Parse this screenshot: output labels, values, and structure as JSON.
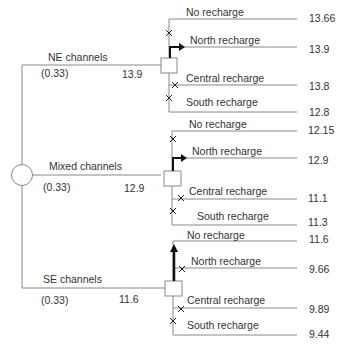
{
  "diagram": {
    "type": "decision-tree",
    "root": {
      "shape": "chance-node-circle"
    },
    "channels": [
      {
        "label": "NE channels",
        "probability": "(0.33)",
        "value": "13.9",
        "decision_box": true,
        "options": [
          {
            "label": "No recharge",
            "value": "13.66",
            "marker": "cross"
          },
          {
            "label": "North recharge",
            "value": "13.9",
            "marker": "arrow-chosen"
          },
          {
            "label": "Central recharge",
            "value": "13.8",
            "marker": "cross"
          },
          {
            "label": "South recharge",
            "value": "12.8",
            "marker": "cross"
          }
        ]
      },
      {
        "label": "Mixed channels",
        "probability": "(0.33)",
        "value": "12.9",
        "decision_box": true,
        "options": [
          {
            "label": "No recharge",
            "value": "12.15",
            "marker": "cross"
          },
          {
            "label": "North recharge",
            "value": "12.9",
            "marker": "arrow-chosen"
          },
          {
            "label": "Central recharge",
            "value": "11.1",
            "marker": "cross"
          },
          {
            "label": "South recharge",
            "value": "11.3",
            "marker": "cross"
          }
        ]
      },
      {
        "label": "SE channels",
        "probability": "(0.33)",
        "value": "11.6",
        "decision_box": true,
        "options": [
          {
            "label": "No recharge",
            "value": "11.6",
            "marker": "arrow-chosen"
          },
          {
            "label": "North recharge",
            "value": "9.66",
            "marker": "cross"
          },
          {
            "label": "Central recharge",
            "value": "9.89",
            "marker": "cross"
          },
          {
            "label": "South recharge",
            "value": "9.44",
            "marker": "cross"
          }
        ]
      }
    ],
    "colors": {
      "line": "#888888",
      "arrow": "#111111",
      "text": "#333333"
    }
  }
}
